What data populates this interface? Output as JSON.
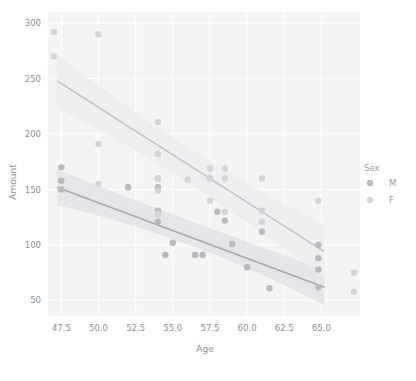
{
  "chart_data": {
    "type": "scatter",
    "title": "",
    "xlabel": "Age",
    "ylabel": "Amount",
    "xlim": [
      46.6,
      67.6
    ],
    "ylim": [
      36,
      310
    ],
    "xticks": [
      "47.5",
      "50.0",
      "52.5",
      "55.0",
      "57.5",
      "60.0",
      "62.5",
      "65.0"
    ],
    "xtick_values": [
      47.5,
      50.0,
      52.5,
      55.0,
      57.5,
      60.0,
      62.5,
      65.0
    ],
    "yticks": [
      "50",
      "100",
      "150",
      "200",
      "250",
      "300"
    ],
    "ytick_values": [
      50,
      100,
      150,
      200,
      250,
      300
    ],
    "grid": true,
    "grid_color": "#ffffff",
    "panel_background": "#f4f4f5",
    "legend": {
      "title": "Sex",
      "position": "right",
      "entries": [
        {
          "label": "M",
          "color": "#b9b9bf"
        },
        {
          "label": "F",
          "color": "#d4d4d8"
        }
      ]
    },
    "series": [
      {
        "name": "M",
        "color": "#b9b9bf",
        "line_color": "#a8a8b0",
        "band_color": "#e2e2e6",
        "regression": {
          "x0": 47.2,
          "y0": 152,
          "x1": 65.2,
          "y1": 62
        },
        "band": {
          "upper0": 168,
          "lower0": 136,
          "upper_mid": 120,
          "lower_mid": 108,
          "upper1": 78,
          "lower1": 46
        },
        "points": [
          {
            "x": 47.5,
            "y": 170
          },
          {
            "x": 47.5,
            "y": 158
          },
          {
            "x": 47.5,
            "y": 150
          },
          {
            "x": 54.0,
            "y": 160
          },
          {
            "x": 54.0,
            "y": 152
          },
          {
            "x": 54.0,
            "y": 131
          },
          {
            "x": 54.0,
            "y": 121
          },
          {
            "x": 54.5,
            "y": 91
          },
          {
            "x": 55.0,
            "y": 102
          },
          {
            "x": 56.5,
            "y": 91
          },
          {
            "x": 57.0,
            "y": 91
          },
          {
            "x": 58.0,
            "y": 130
          },
          {
            "x": 58.5,
            "y": 122
          },
          {
            "x": 59.0,
            "y": 101
          },
          {
            "x": 60.0,
            "y": 80
          },
          {
            "x": 61.0,
            "y": 112
          },
          {
            "x": 61.5,
            "y": 61
          },
          {
            "x": 64.8,
            "y": 100
          },
          {
            "x": 64.8,
            "y": 88
          },
          {
            "x": 64.8,
            "y": 78
          },
          {
            "x": 64.8,
            "y": 62
          },
          {
            "x": 57.5,
            "y": 160
          },
          {
            "x": 52.0,
            "y": 152
          }
        ]
      },
      {
        "name": "F",
        "color": "#d4d4d8",
        "line_color": "#c4c4ca",
        "band_color": "#ececf0",
        "regression": {
          "x0": 47.2,
          "y0": 248,
          "x1": 65.2,
          "y1": 94
        },
        "band": {
          "upper0": 272,
          "lower0": 224,
          "upper_mid": 178,
          "lower_mid": 162,
          "upper1": 118,
          "lower1": 70
        },
        "points": [
          {
            "x": 47.0,
            "y": 292
          },
          {
            "x": 47.0,
            "y": 270
          },
          {
            "x": 50.0,
            "y": 290
          },
          {
            "x": 50.0,
            "y": 191
          },
          {
            "x": 50.0,
            "y": 155
          },
          {
            "x": 54.0,
            "y": 211
          },
          {
            "x": 54.0,
            "y": 182
          },
          {
            "x": 54.0,
            "y": 160
          },
          {
            "x": 54.0,
            "y": 149
          },
          {
            "x": 54.0,
            "y": 128
          },
          {
            "x": 56.0,
            "y": 159
          },
          {
            "x": 57.5,
            "y": 169
          },
          {
            "x": 57.5,
            "y": 160
          },
          {
            "x": 57.5,
            "y": 140
          },
          {
            "x": 58.5,
            "y": 169
          },
          {
            "x": 58.5,
            "y": 160
          },
          {
            "x": 58.5,
            "y": 130
          },
          {
            "x": 61.0,
            "y": 160
          },
          {
            "x": 61.0,
            "y": 131
          },
          {
            "x": 61.0,
            "y": 121
          },
          {
            "x": 64.8,
            "y": 140
          },
          {
            "x": 67.2,
            "y": 75
          },
          {
            "x": 67.2,
            "y": 58
          }
        ]
      }
    ]
  }
}
